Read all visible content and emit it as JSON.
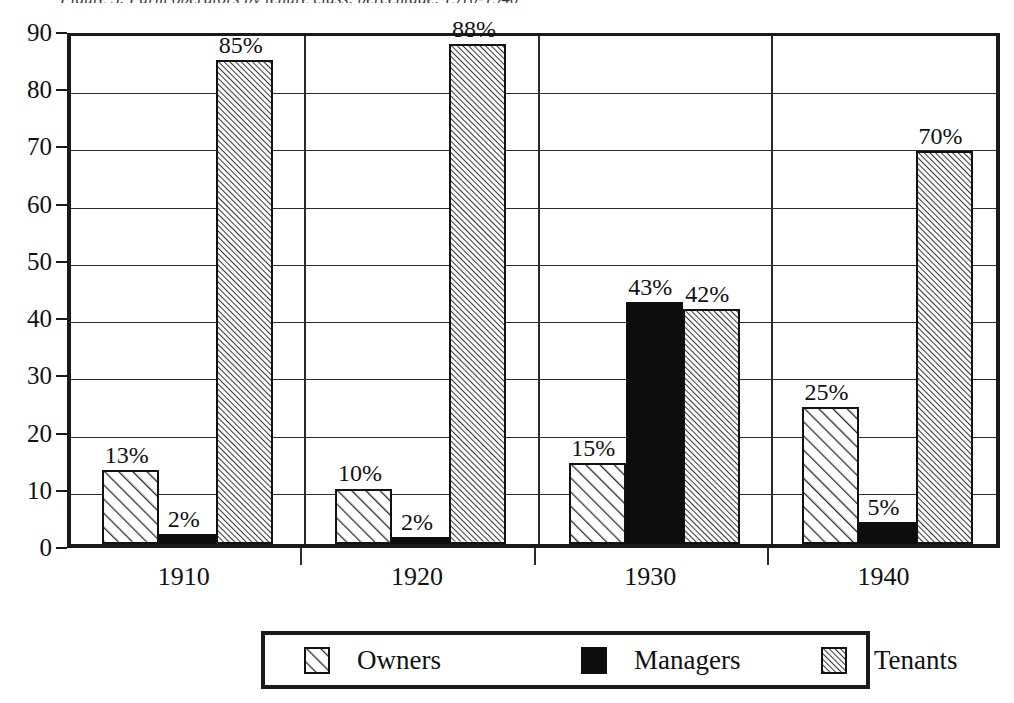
{
  "figure": {
    "cropped_caption": "Figure 3.  Farm operators by tenure class, percentage, 1910-1940"
  },
  "chart_data": {
    "type": "bar",
    "title": "",
    "xlabel": "",
    "ylabel": "",
    "categories": [
      "1910",
      "1920",
      "1930",
      "1940"
    ],
    "series": [
      {
        "name": "Owners",
        "pattern": "diagonal-hatch-sparse",
        "values": [
          13,
          10,
          15,
          25
        ],
        "labels": [
          "13%",
          "10%",
          "15%",
          "25%"
        ],
        "bar_heights": [
          12.9,
          9.7,
          14.2,
          24.0
        ]
      },
      {
        "name": "Managers",
        "pattern": "solid-black",
        "values": [
          2,
          2,
          43,
          5
        ],
        "labels": [
          "2%",
          "2%",
          "43%",
          "5%"
        ],
        "bar_heights": [
          1.8,
          1.3,
          42.3,
          3.8
        ]
      },
      {
        "name": "Tenants",
        "pattern": "diagonal-hatch-dense",
        "values": [
          85,
          88,
          42,
          70
        ],
        "labels": [
          "85%",
          "88%",
          "42%",
          "70%"
        ],
        "bar_heights": [
          84.6,
          87.3,
          41.1,
          68.7
        ]
      }
    ],
    "ylim": [
      0,
      90
    ],
    "yticks": [
      "0",
      "10",
      "20",
      "30",
      "40",
      "50",
      "60",
      "70",
      "80",
      "90"
    ],
    "ytick_values": [
      0,
      10,
      20,
      30,
      40,
      50,
      60,
      70,
      80,
      90
    ],
    "grid": "horizontal",
    "legend_position": "bottom",
    "legend_entries": [
      "Owners",
      "Managers",
      "Tenants"
    ],
    "colors": {
      "line": "#1a1a1a",
      "grid": "#2b2b2b",
      "managers_fill": "#0d0d0d",
      "hatch": "#2e2e2e",
      "background": "#ffffff"
    }
  },
  "legend": {
    "items": [
      {
        "label": "Owners",
        "swatch": "swatch-owners-hatch"
      },
      {
        "label": "Managers",
        "swatch": "swatch-managers-solid"
      },
      {
        "label": "Tenants",
        "swatch": "swatch-tenants-hatch"
      }
    ]
  }
}
